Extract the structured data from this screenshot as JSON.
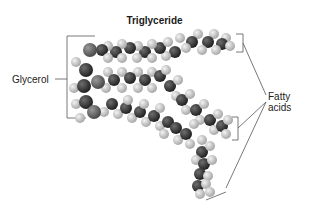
{
  "title": "Triglyceride",
  "labels": {
    "glycerol": "Glycerol",
    "fatty_line1": "Fatty",
    "fatty_line2": "acids"
  },
  "colors": {
    "carbon": "#3a3a3a",
    "oxygen": "#6a6a6a",
    "hydrogen": "#cfcfcf",
    "line": "#555555"
  }
}
